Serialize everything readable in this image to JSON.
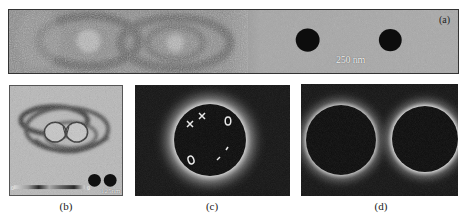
{
  "figure": {
    "panels": [
      {
        "id": "a",
        "label": "(a)",
        "description": "Electron holography phase image (left half, noisy rings) and TEM image of two nanodisks (right half)",
        "scale_bar": "250 nm"
      },
      {
        "id": "b",
        "label": "(b)",
        "description": "Magnetic flux line map around two nanodisks with colorbar",
        "colorbar_min": "0",
        "colorbar_max": "0",
        "scale_bar": "125nm"
      },
      {
        "id": "c",
        "label": "(c)",
        "description": "Dark field image of single disk with markers",
        "markers": [
          "×",
          "×",
          "O",
          "O",
          "-",
          "-"
        ]
      },
      {
        "id": "d",
        "label": "(d)",
        "description": "Dark field image of two disks"
      }
    ]
  },
  "colors": {
    "panel_a_left_bg": "#8a8a8a",
    "panel_a_right_bg": "#a9a9a9",
    "panel_b_bg": "#b5b5b5",
    "dark_bg": "#151515",
    "halo": "#cfcfcf",
    "disk": "#0c0c0c"
  }
}
